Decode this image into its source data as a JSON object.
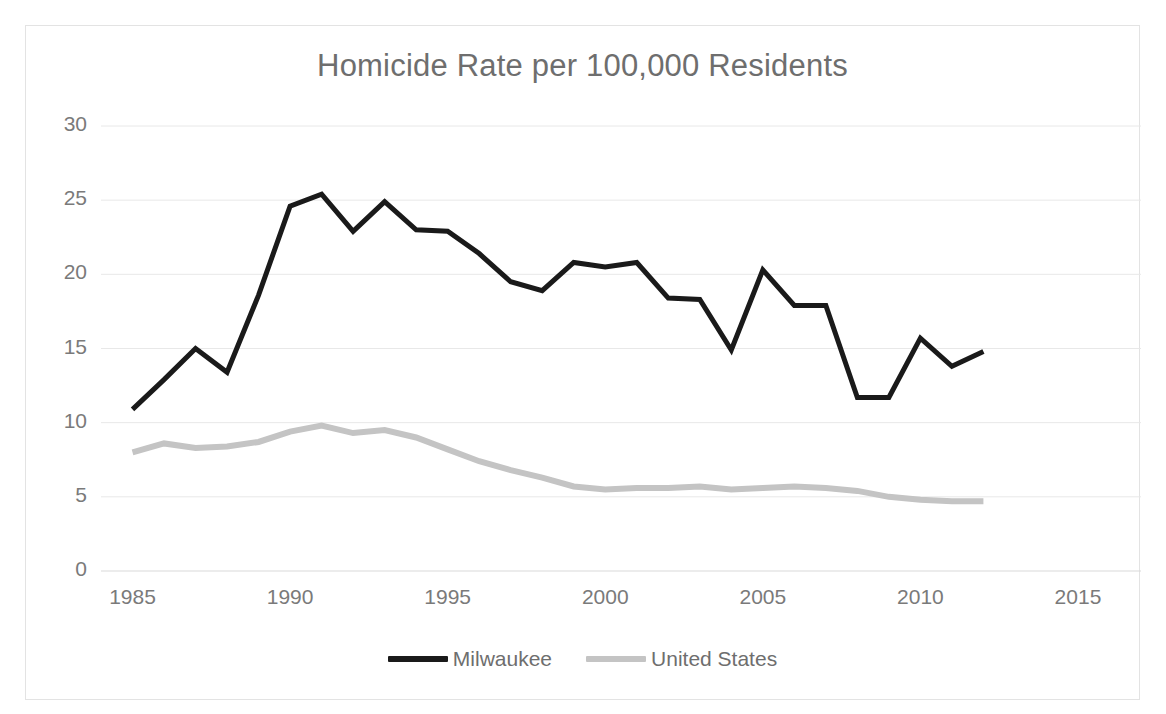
{
  "chart_data": {
    "type": "line",
    "title": "Homicide Rate per 100,000 Residents",
    "xlabel": "",
    "ylabel": "",
    "xlim": [
      1984,
      2017
    ],
    "ylim": [
      0,
      30
    ],
    "ytick_labels": [
      "30",
      "25",
      "20",
      "15",
      "10",
      "5",
      "0"
    ],
    "yticks": [
      30,
      25,
      20,
      15,
      10,
      5,
      0
    ],
    "xtick_labels": [
      "1985",
      "1990",
      "1995",
      "2000",
      "2005",
      "2010",
      "2015"
    ],
    "xticks": [
      1985,
      1990,
      1995,
      2000,
      2005,
      2010,
      2015
    ],
    "grid": "horizontal",
    "legend_position": "bottom",
    "x": [
      1985,
      1986,
      1987,
      1988,
      1989,
      1990,
      1991,
      1992,
      1993,
      1994,
      1995,
      1996,
      1997,
      1998,
      1999,
      2000,
      2001,
      2002,
      2003,
      2004,
      2005,
      2006,
      2007,
      2008,
      2009,
      2010,
      2011,
      2012
    ],
    "series": [
      {
        "name": "Milwaukee",
        "color": "#1a1a1a",
        "width": 5,
        "values": [
          10.9,
          12.9,
          15.0,
          13.4,
          18.6,
          24.6,
          25.4,
          22.9,
          24.9,
          23.0,
          22.9,
          21.4,
          19.5,
          18.9,
          20.8,
          20.5,
          20.8,
          18.4,
          18.3,
          14.9,
          20.3,
          17.9,
          17.9,
          11.7,
          11.7,
          15.7,
          13.8,
          14.8
        ]
      },
      {
        "name": "United States",
        "color": "#c4c4c4",
        "width": 6,
        "values": [
          8.0,
          8.6,
          8.3,
          8.4,
          8.7,
          9.4,
          9.8,
          9.3,
          9.5,
          9.0,
          8.2,
          7.4,
          6.8,
          6.3,
          5.7,
          5.5,
          5.6,
          5.6,
          5.7,
          5.5,
          5.6,
          5.7,
          5.6,
          5.4,
          5.0,
          4.8,
          4.7,
          4.7
        ]
      }
    ]
  }
}
